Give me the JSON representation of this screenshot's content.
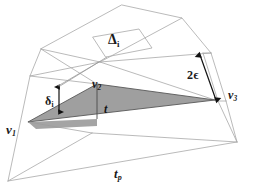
{
  "figure": {
    "kind": "geometry-diagram",
    "background_color": "#ffffff",
    "wireframe_color": "#aaaaaa",
    "shaded_fill_color": "#999999",
    "shaded_edge_color": "#4d4d4d",
    "annotation_color": "#1a1a1a",
    "labels": {
      "v1": "v",
      "v1_sub": "1",
      "v2": "v",
      "v2_sub": "2",
      "v3": "v",
      "v3_sub": "3",
      "triangle": "t",
      "base_triangle": "t",
      "base_triangle_sub": "p",
      "delta_i": "δ",
      "delta_i_sub": "i",
      "big_delta": "Δ",
      "big_delta_sub": "i",
      "two_epsilon": "2ϵ"
    },
    "annotations": [
      {
        "name": "delta-i-measure",
        "label": "δi",
        "meaning": "vertical offset distance marked by a double-headed arrow near vertex v1"
      },
      {
        "name": "two-epsilon-measure",
        "label": "2ϵ",
        "meaning": "slab thickness marked by a double-headed arrow on the right side near vertex v3"
      },
      {
        "name": "big-delta-i-label",
        "label": "Δi",
        "meaning": "upper wireframe facet label"
      },
      {
        "name": "base-triangle-label",
        "label": "tp",
        "meaning": "projected base triangle label at the bottom"
      }
    ]
  }
}
